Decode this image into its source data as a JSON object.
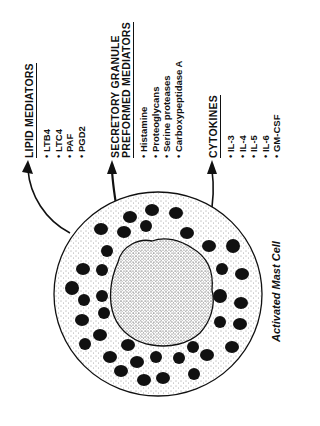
{
  "groups": [
    {
      "title_lines": [
        "LIPID MEDIATORS"
      ],
      "items": [
        "LTB4",
        "LTC4",
        "PAF",
        "PGD2"
      ]
    },
    {
      "title_lines": [
        "SECRETORY GRANULE",
        "PREFORMED MEDIATORS"
      ],
      "items": [
        "Histamine",
        "Proteoglycans",
        "Serine proteases",
        "Carboxypeptidase A"
      ]
    },
    {
      "title_lines": [
        "CYTOKINES"
      ],
      "items": [
        "IL-3",
        "IL-4",
        "IL-5",
        "IL-6",
        "GM-CSF"
      ]
    }
  ],
  "caption": "Activated Mast Cell",
  "colors": {
    "ink": "#111111",
    "background": "#ffffff"
  }
}
